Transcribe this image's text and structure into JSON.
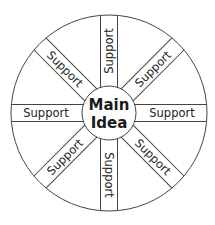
{
  "diagram": {
    "type": "wheel",
    "center": {
      "line1": "Main",
      "line2": "Idea"
    },
    "spokes": [
      {
        "position": "top",
        "label": "Support"
      },
      {
        "position": "top-right",
        "label": "Support"
      },
      {
        "position": "right",
        "label": "Support"
      },
      {
        "position": "bottom-right",
        "label": "Support"
      },
      {
        "position": "bottom",
        "label": "Support"
      },
      {
        "position": "bottom-left",
        "label": "Support"
      },
      {
        "position": "left",
        "label": "Support"
      },
      {
        "position": "top-left",
        "label": "Support"
      }
    ],
    "colors": {
      "line": "#444444",
      "text": "#222222",
      "background": "#ffffff"
    }
  }
}
